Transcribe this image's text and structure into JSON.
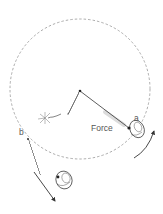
{
  "diagram": {
    "labels": {
      "force": "Force",
      "point_a": "a",
      "point_b": "b"
    },
    "colors": {
      "background": "#ffffff",
      "line": "#333333",
      "dashed_path": "#888888",
      "label": "#555555",
      "highlight": "#d8d8d8"
    },
    "elements": [
      {
        "name": "circular-path",
        "kind": "dashed circle"
      },
      {
        "name": "pivot",
        "kind": "center point"
      },
      {
        "name": "taut-string",
        "kind": "line pivot to a"
      },
      {
        "name": "broken-string",
        "kind": "wavy line pivot to break"
      },
      {
        "name": "break-starburst",
        "kind": "snap mark"
      },
      {
        "name": "object-a",
        "kind": "object on circle at a"
      },
      {
        "name": "object-b",
        "kind": "object flying off at b"
      },
      {
        "name": "motion-arrow-a",
        "kind": "curved arrow along circle"
      },
      {
        "name": "motion-arrow-b",
        "kind": "straight tangent arrow"
      }
    ]
  }
}
